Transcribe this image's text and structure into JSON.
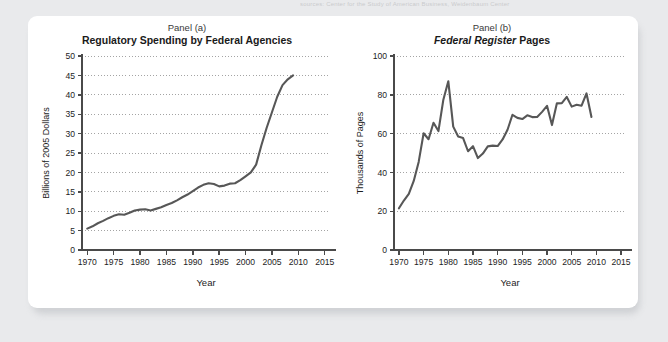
{
  "page": {
    "background_color": "#e9eaec",
    "card_color": "#ffffff",
    "top_caption": "sources: Center for the Study of American Business, Weidenbaum Center"
  },
  "style": {
    "line_color": "#575757",
    "axis_color": "#4a4a4a",
    "grid_color": "#9a9a9a",
    "text_color": "#1d1d1d"
  },
  "panels": [
    {
      "caption": "Panel (a)",
      "title_plain": "Regulatory Spending by Federal Agencies",
      "title_italic_part": "",
      "title_rest": ""
    },
    {
      "caption": "Panel (b)",
      "title_plain": "",
      "title_italic_part": "Federal Register",
      "title_rest": " Pages"
    }
  ],
  "chart_data": [
    {
      "type": "line",
      "panel": "Panel (a)",
      "title": "Regulatory Spending by Federal Agencies",
      "xlabel": "Year",
      "ylabel": "Billions of 2005 Dollars",
      "xlim": [
        1969,
        2016
      ],
      "ylim": [
        0,
        50
      ],
      "xticks": [
        1970,
        1975,
        1980,
        1985,
        1990,
        1995,
        2000,
        2005,
        2010,
        2015
      ],
      "yticks": [
        0,
        5,
        10,
        15,
        20,
        25,
        30,
        35,
        40,
        45,
        50
      ],
      "xtick_labels": [
        "1970",
        "1975",
        "1980",
        "1985",
        "1990",
        "1995",
        "2000",
        "2005",
        "2010",
        "2015"
      ],
      "ytick_labels": [
        "0",
        "5",
        "10",
        "15",
        "20",
        "25",
        "30",
        "35",
        "40",
        "45",
        "50"
      ],
      "grid": "horizontal-dotted",
      "legend": "none",
      "series": [
        {
          "name": "Regulatory spending",
          "x": [
            1970,
            1971,
            1972,
            1973,
            1974,
            1975,
            1976,
            1977,
            1978,
            1979,
            1980,
            1981,
            1982,
            1983,
            1984,
            1985,
            1986,
            1987,
            1988,
            1989,
            1990,
            1991,
            1992,
            1993,
            1994,
            1995,
            1996,
            1997,
            1998,
            1999,
            2000,
            2001,
            2002,
            2003,
            2004,
            2005,
            2006,
            2007,
            2008,
            2009
          ],
          "y": [
            5.5,
            6.1,
            6.9,
            7.5,
            8.2,
            8.8,
            9.2,
            9.1,
            9.6,
            10.2,
            10.4,
            10.5,
            10.2,
            10.6,
            11.0,
            11.6,
            12.1,
            12.8,
            13.6,
            14.3,
            15.2,
            16.1,
            16.8,
            17.2,
            17.0,
            16.4,
            16.6,
            17.1,
            17.2,
            18.0,
            19.0,
            20.0,
            22.0,
            27.0,
            31.5,
            35.5,
            39.5,
            42.5,
            44.0,
            45.0
          ]
        }
      ]
    },
    {
      "type": "line",
      "panel": "Panel (b)",
      "title": "Federal Register Pages",
      "xlabel": "Year",
      "ylabel": "Thousands of Pages",
      "xlim": [
        1969,
        2016
      ],
      "ylim": [
        0,
        100
      ],
      "xticks": [
        1970,
        1975,
        1980,
        1985,
        1990,
        1995,
        2000,
        2005,
        2010,
        2015
      ],
      "yticks": [
        0,
        20,
        40,
        60,
        80,
        100
      ],
      "xtick_labels": [
        "1970",
        "1975",
        "1980",
        "1985",
        "1990",
        "1995",
        "2000",
        "2005",
        "2010",
        "2015"
      ],
      "ytick_labels": [
        "0",
        "20",
        "40",
        "60",
        "80",
        "100"
      ],
      "grid": "horizontal-dotted",
      "legend": "none",
      "series": [
        {
          "name": "Federal Register pages",
          "x": [
            1970,
            1971,
            1972,
            1973,
            1974,
            1975,
            1976,
            1977,
            1978,
            1979,
            1980,
            1981,
            1982,
            1983,
            1984,
            1985,
            1986,
            1987,
            1988,
            1989,
            1990,
            1991,
            1992,
            1993,
            1994,
            1995,
            1996,
            1997,
            1998,
            1999,
            2000,
            2001,
            2002,
            2003,
            2004,
            2005,
            2006,
            2007,
            2008,
            2009
          ],
          "y": [
            21.5,
            25.5,
            28.9,
            35.6,
            45.4,
            60.2,
            57.1,
            65.6,
            61.3,
            77.5,
            87.0,
            63.6,
            58.5,
            57.7,
            50.9,
            53.5,
            47.4,
            49.7,
            53.4,
            53.8,
            53.6,
            57.0,
            62.0,
            69.7,
            68.1,
            67.5,
            69.4,
            68.5,
            68.6,
            71.2,
            74.3,
            64.4,
            75.6,
            75.7,
            78.9,
            73.9,
            74.9,
            74.4,
            80.7,
            68.6
          ]
        }
      ]
    }
  ]
}
